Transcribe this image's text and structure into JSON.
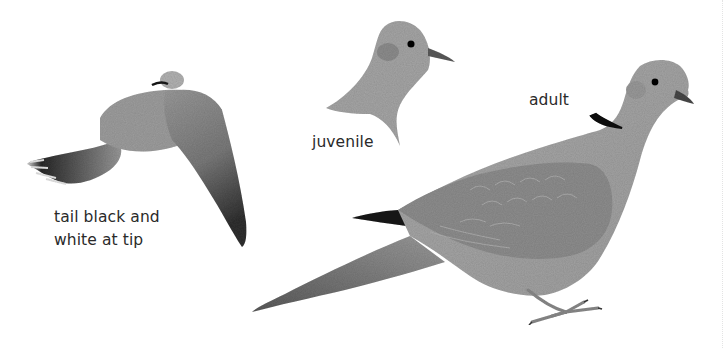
{
  "figure": {
    "labels": {
      "flight": [
        "tail black and",
        "white at tip"
      ],
      "juvenile": "juvenile",
      "adult": "adult"
    },
    "colors": {
      "background": "#ffffff",
      "body_gray": "#a9a9a9",
      "wing_gray": "#8f8f8f",
      "dark_gray": "#555555",
      "collar_black": "#141414",
      "text": "#2a2a2a"
    }
  }
}
